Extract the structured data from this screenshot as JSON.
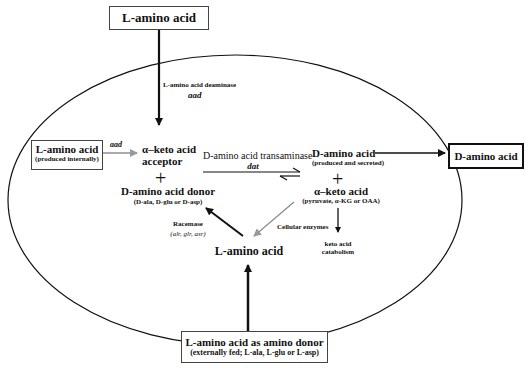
{
  "diagram": {
    "top_box": {
      "label": "L-amino acid"
    },
    "deaminase": {
      "label": "L-amino acid deaminase",
      "gene": "aad"
    },
    "internal_box": {
      "label": "L-amino acid",
      "sublabel": "(produced internally)"
    },
    "internal_arrow_gene": "aad",
    "keto_acceptor": {
      "line1": "α–keto acid",
      "line2": "acceptor"
    },
    "plus_left": "+",
    "d_donor": {
      "label": "D-amino acid donor",
      "sublabel": "(D-ala, D-glu or D-asp)"
    },
    "transaminase": {
      "label": "D-amino acid transaminase",
      "gene": "dat"
    },
    "d_amino_product": {
      "label": "D-amino acid",
      "sublabel": "(produced and secreted)"
    },
    "plus_right": "+",
    "keto_product": {
      "label": "α–keto acid",
      "sublabel": "(pyruvate, α-KG  or OAA)"
    },
    "racemase": {
      "label": "Racemase",
      "genes": "(alr, glr, asr)"
    },
    "cellular_enzymes": "Cellular enzymes",
    "catabolism": {
      "line1": "keto acid",
      "line2": "catabolism"
    },
    "l_amino_center": "L-amino acid",
    "secreted_box": {
      "label": "D-amino acid"
    },
    "bottom_box": {
      "label": "L-amino acid as amino donor",
      "sublabel": "(externally fed; L-ala, L-glu or L-asp)"
    }
  }
}
